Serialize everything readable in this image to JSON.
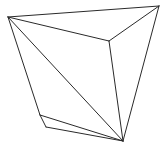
{
  "figure": {
    "width": 166,
    "height": 147,
    "background": "#ffffff",
    "stroke_color": "#2a2a2a",
    "stroke_width": 1,
    "vertices": {
      "A": [
        8,
        17
      ],
      "B": [
        159,
        6
      ],
      "C": [
        109,
        41
      ],
      "D": [
        40,
        115
      ],
      "E": [
        46,
        127
      ],
      "F": [
        123,
        141
      ]
    },
    "edges": [
      [
        "A",
        "B"
      ],
      [
        "A",
        "C"
      ],
      [
        "B",
        "C"
      ],
      [
        "A",
        "D"
      ],
      [
        "A",
        "F"
      ],
      [
        "C",
        "F"
      ],
      [
        "B",
        "F"
      ],
      [
        "D",
        "E"
      ],
      [
        "D",
        "F"
      ],
      [
        "E",
        "F"
      ]
    ]
  }
}
